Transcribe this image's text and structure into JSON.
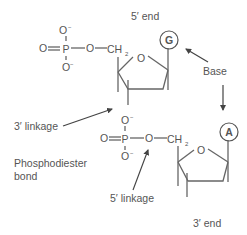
{
  "labels": {
    "five_prime_end": "5′ end",
    "three_prime_end": "3′ end",
    "base": "Base",
    "three_prime_linkage": "3′ linkage",
    "five_prime_linkage": "5′ linkage",
    "phosphodiester_line1": "Phosphodiester",
    "phosphodiester_line2": "bond"
  },
  "atoms": {
    "oxygen": "O",
    "phosphorus": "P",
    "carbon_ch": "CH",
    "ch_subscript": "2",
    "minus": "−"
  },
  "bases": {
    "top": "G",
    "bottom": "A"
  },
  "colors": {
    "text": "#555555",
    "bond": "#666666",
    "arrow": "#444444",
    "background": "#ffffff"
  }
}
